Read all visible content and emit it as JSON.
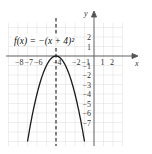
{
  "chart_data": {
    "type": "line",
    "title": "",
    "equation": "f(x) = −(x + 4)²",
    "xlabel": "x",
    "ylabel": "y",
    "xlim": [
      -9,
      3
    ],
    "ylim": [
      -9,
      3.5
    ],
    "grid": true,
    "x_tick_labels": [
      "−8",
      "−7",
      "−6",
      "−4",
      "−2",
      "−1",
      "1",
      "2"
    ],
    "y_tick_labels": [
      "2",
      "1",
      "−1",
      "−2",
      "−3",
      "−4",
      "−5",
      "−6",
      "−7"
    ],
    "vertex": {
      "x": -4,
      "y": 0
    },
    "axis_of_symmetry": "x = −4 (dashed)",
    "series": [
      {
        "name": "f(x) = −(x + 4)²",
        "x": [
          -7,
          -6.5,
          -6,
          -5.5,
          -5,
          -4.5,
          -4,
          -3.5,
          -3,
          -2.5,
          -2,
          -1.5,
          -1
        ],
        "values": [
          -9,
          -6.25,
          -4,
          -2.25,
          -1,
          -0.25,
          0,
          -0.25,
          -1,
          -2.25,
          -4,
          -6.25,
          -9
        ]
      }
    ],
    "colors": {
      "curve": "#1a1a1a",
      "grid": "#dcdcdc",
      "axes": "#444444"
    }
  }
}
